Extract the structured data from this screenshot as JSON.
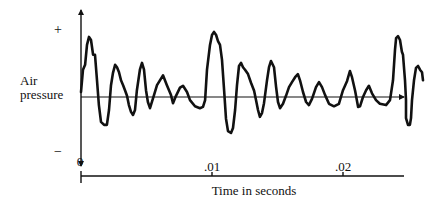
{
  "chart_data": {
    "type": "line",
    "title": "",
    "xlabel": "Time in seconds",
    "ylabel_lines": [
      "Air",
      "pressure"
    ],
    "y_positive_label": "+",
    "y_negative_label": "−",
    "x_ticks": [
      {
        "value": 0,
        "label": "0"
      },
      {
        "value": 0.01,
        "label": ".01"
      },
      {
        "value": 0.02,
        "label": ".02"
      }
    ],
    "xlim": [
      0,
      0.0247
    ],
    "ylim": [
      -1.1,
      1.2
    ],
    "y_units": "relative air pressure (+1 = '+' mark, -1 = '−' mark)",
    "grid": false,
    "legend": "none",
    "colors": {
      "ink": "#111111",
      "background": "#ffffff"
    },
    "series": [
      {
        "name": "Air pressure waveform",
        "points": [
          [
            0.0,
            0.08
          ],
          [
            0.00015,
            0.44
          ],
          [
            0.00031,
            0.52
          ],
          [
            0.00046,
            0.84
          ],
          [
            0.00061,
            0.97
          ],
          [
            0.00076,
            0.92
          ],
          [
            0.00092,
            0.68
          ],
          [
            0.00107,
            0.68
          ],
          [
            0.00122,
            0.27
          ],
          [
            0.00137,
            -0.13
          ],
          [
            0.00153,
            -0.4
          ],
          [
            0.00176,
            -0.45
          ],
          [
            0.00198,
            -0.45
          ],
          [
            0.00214,
            -0.21
          ],
          [
            0.00229,
            0.19
          ],
          [
            0.00244,
            0.39
          ],
          [
            0.0026,
            0.52
          ],
          [
            0.00275,
            0.48
          ],
          [
            0.0029,
            0.4
          ],
          [
            0.00305,
            0.27
          ],
          [
            0.00321,
            0.19
          ],
          [
            0.00336,
            0.11
          ],
          [
            0.00351,
            0.02
          ],
          [
            0.00366,
            -0.13
          ],
          [
            0.00382,
            -0.24
          ],
          [
            0.00397,
            -0.29
          ],
          [
            0.00412,
            -0.21
          ],
          [
            0.00427,
            0.11
          ],
          [
            0.0045,
            0.44
          ],
          [
            0.00466,
            0.55
          ],
          [
            0.00481,
            0.44
          ],
          [
            0.00496,
            0.11
          ],
          [
            0.00511,
            -0.08
          ],
          [
            0.00527,
            -0.18
          ],
          [
            0.00557,
            0.03
          ],
          [
            0.0058,
            0.19
          ],
          [
            0.00626,
            0.35
          ],
          [
            0.00656,
            0.19
          ],
          [
            0.00687,
            0.03
          ],
          [
            0.00702,
            -0.1
          ],
          [
            0.00725,
            0.02
          ],
          [
            0.00756,
            0.15
          ],
          [
            0.00779,
            0.18
          ],
          [
            0.00809,
            0.08
          ],
          [
            0.00832,
            -0.05
          ],
          [
            0.0087,
            -0.15
          ],
          [
            0.00908,
            -0.18
          ],
          [
            0.00931,
            -0.16
          ],
          [
            0.00947,
            -0.05
          ],
          [
            0.00962,
            0.44
          ],
          [
            0.00985,
            0.84
          ],
          [
            0.01,
            1.0
          ],
          [
            0.01015,
            1.05
          ],
          [
            0.01031,
            1.0
          ],
          [
            0.01046,
            0.9
          ],
          [
            0.01061,
            0.84
          ],
          [
            0.01076,
            0.6
          ],
          [
            0.01092,
            0.11
          ],
          [
            0.01107,
            -0.35
          ],
          [
            0.01122,
            -0.55
          ],
          [
            0.01145,
            -0.58
          ],
          [
            0.0116,
            -0.5
          ],
          [
            0.01176,
            -0.21
          ],
          [
            0.01191,
            0.19
          ],
          [
            0.01206,
            0.5
          ],
          [
            0.01221,
            0.55
          ],
          [
            0.01237,
            0.48
          ],
          [
            0.01252,
            0.44
          ],
          [
            0.01275,
            0.37
          ],
          [
            0.01298,
            0.23
          ],
          [
            0.01321,
            0.1
          ],
          [
            0.01336,
            -0.05
          ],
          [
            0.01351,
            -0.21
          ],
          [
            0.01366,
            -0.32
          ],
          [
            0.01382,
            -0.26
          ],
          [
            0.01397,
            -0.1
          ],
          [
            0.0142,
            0.27
          ],
          [
            0.01435,
            0.48
          ],
          [
            0.0145,
            0.58
          ],
          [
            0.01473,
            0.48
          ],
          [
            0.01489,
            0.16
          ],
          [
            0.01504,
            -0.08
          ],
          [
            0.01519,
            -0.18
          ],
          [
            0.01542,
            -0.11
          ],
          [
            0.01565,
            0.02
          ],
          [
            0.01588,
            0.16
          ],
          [
            0.01611,
            0.24
          ],
          [
            0.01634,
            0.32
          ],
          [
            0.01656,
            0.37
          ],
          [
            0.01672,
            0.27
          ],
          [
            0.01695,
            0.08
          ],
          [
            0.01718,
            -0.08
          ],
          [
            0.0174,
            -0.13
          ],
          [
            0.01763,
            -0.03
          ],
          [
            0.01794,
            0.16
          ],
          [
            0.01817,
            0.24
          ],
          [
            0.0184,
            0.16
          ],
          [
            0.01863,
            0.03
          ],
          [
            0.01893,
            -0.11
          ],
          [
            0.01931,
            -0.15
          ],
          [
            0.01969,
            -0.11
          ],
          [
            0.02,
            0.11
          ],
          [
            0.02031,
            0.26
          ],
          [
            0.02053,
            0.42
          ],
          [
            0.02069,
            0.32
          ],
          [
            0.02092,
            0.1
          ],
          [
            0.02115,
            -0.16
          ],
          [
            0.0213,
            -0.15
          ],
          [
            0.02153,
            0.0
          ],
          [
            0.02176,
            0.11
          ],
          [
            0.02198,
            0.18
          ],
          [
            0.02221,
            0.06
          ],
          [
            0.02252,
            -0.05
          ],
          [
            0.02282,
            -0.11
          ],
          [
            0.02328,
            -0.13
          ],
          [
            0.02359,
            -0.05
          ],
          [
            0.02382,
            0.27
          ],
          [
            0.02397,
            0.76
          ],
          [
            0.02405,
            0.95
          ],
          [
            0.0242,
            0.98
          ],
          [
            0.02435,
            0.92
          ],
          [
            0.0245,
            0.73
          ],
          [
            0.02458,
            0.68
          ],
          [
            0.02473,
            0.27
          ],
          [
            0.02481,
            -0.05
          ],
          [
            0.02481,
            -0.34
          ],
          [
            0.02496,
            -0.45
          ],
          [
            0.02511,
            -0.45
          ],
          [
            0.02519,
            -0.34
          ],
          [
            0.02527,
            -0.05
          ],
          [
            0.02542,
            0.27
          ],
          [
            0.02557,
            0.47
          ],
          [
            0.02573,
            0.5
          ],
          [
            0.02588,
            0.44
          ],
          [
            0.02603,
            0.4
          ],
          [
            0.02611,
            0.27
          ]
        ]
      }
    ]
  }
}
